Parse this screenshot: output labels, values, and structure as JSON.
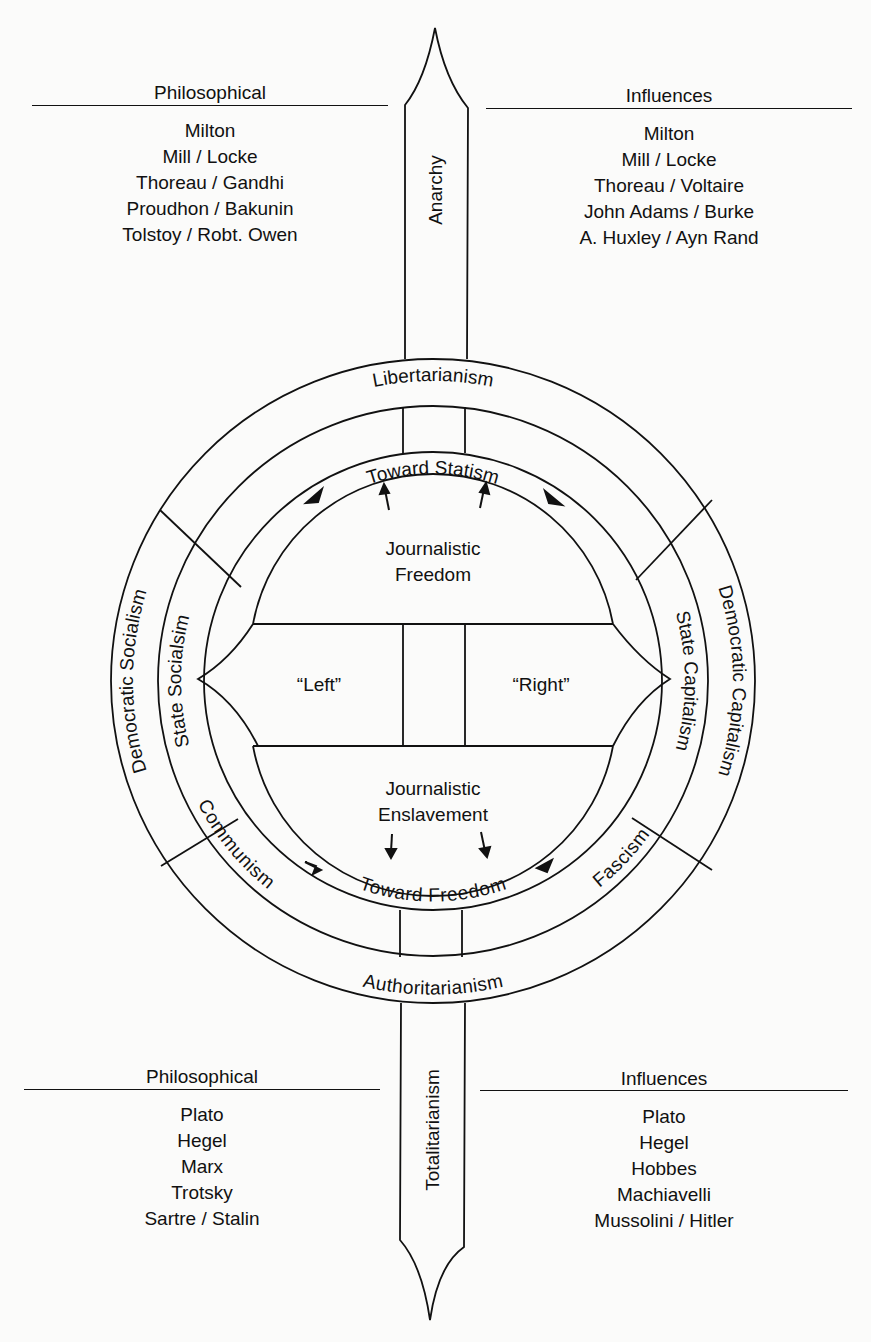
{
  "top": {
    "left_heading": "Philosophical",
    "right_heading": "Influences",
    "left_items": [
      "Milton",
      "Mill / Locke",
      "Thoreau / Gandhi",
      "Proudhon / Bakunin",
      "Tolstoy / Robt. Owen"
    ],
    "right_items": [
      "Milton",
      "Mill / Locke",
      "Thoreau / Voltaire",
      "John Adams / Burke",
      "A. Huxley / Ayn Rand"
    ]
  },
  "bottom": {
    "left_heading": "Philosophical",
    "right_heading": "Influences",
    "left_items": [
      "Plato",
      "Hegel",
      "Marx",
      "Trotsky",
      "Sartre / Stalin"
    ],
    "right_items": [
      "Plato",
      "Hegel",
      "Hobbes",
      "Machiavelli",
      "Mussolini / Hitler"
    ]
  },
  "axis": {
    "top_label": "Anarchy",
    "bottom_label": "Totalitarianism"
  },
  "rings": {
    "outer_top": "Libertarianism",
    "outer_bottom": "Authoritarianism",
    "outer_left": "Democratic Socialism",
    "outer_right": "Democratic Capitalism",
    "middle_left": "State Socialsim",
    "middle_right": "State Capitalism",
    "middle_bottom_left": "Communism",
    "middle_bottom_right": "Fascism",
    "inner_top": "Toward Statism",
    "inner_bottom": "Toward Freedom"
  },
  "center": {
    "upper": [
      "Journalistic",
      "Freedom"
    ],
    "lower": [
      "Journalistic",
      "Enslavement"
    ],
    "left": "“Left”",
    "right": "“Right”"
  }
}
